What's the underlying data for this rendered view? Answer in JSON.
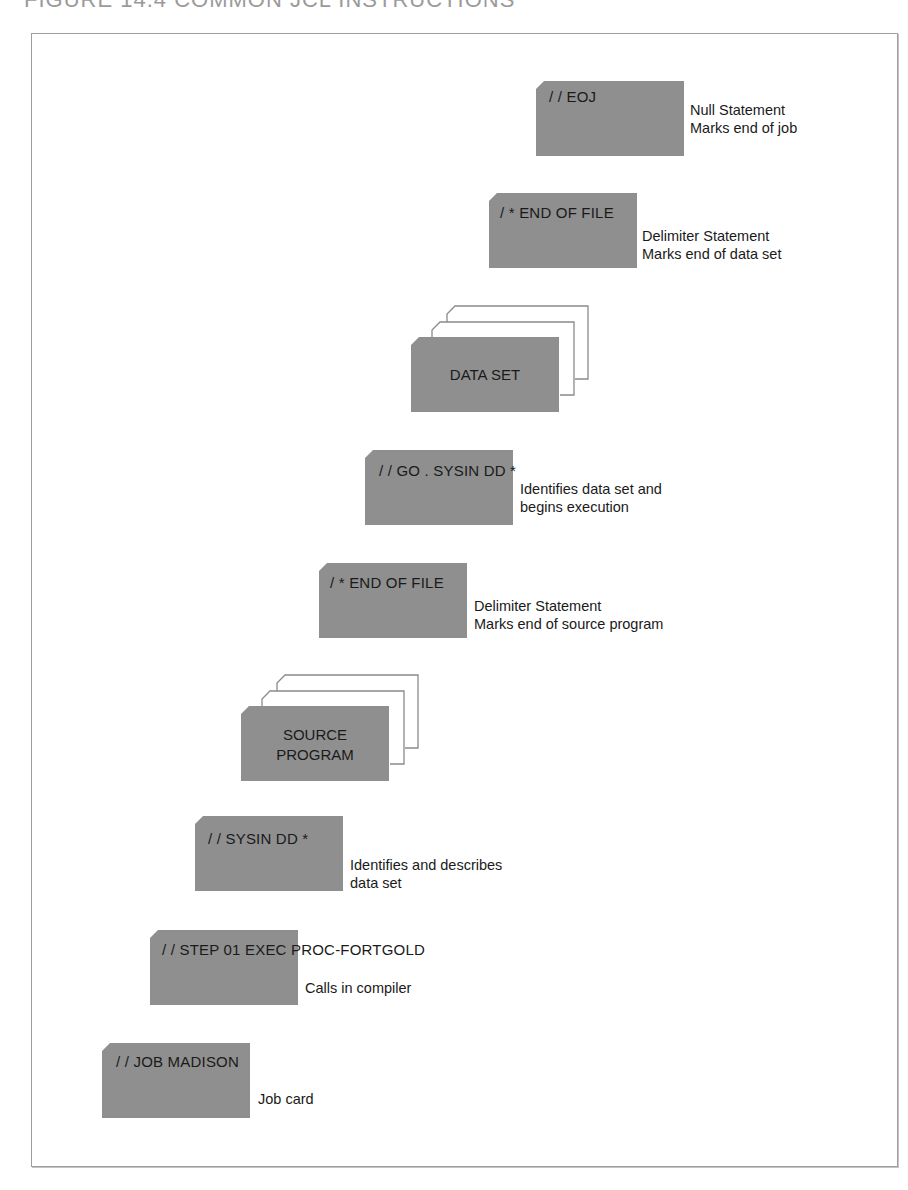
{
  "figure": {
    "title": "FIGURE 14.4   COMMON JCL INSTRUCTIONS"
  },
  "colors": {
    "card_fill": "#8f8f8f",
    "outline": "#8a8a8a",
    "frame": "#9e9e9e"
  },
  "cards": [
    {
      "code": "/ / EOJ",
      "desc_line1": "Null Statement",
      "desc_line2": "Marks end of job"
    },
    {
      "code": "/ * END OF FILE",
      "desc_line1": "Delimiter Statement",
      "desc_line2": "Marks end of data set"
    },
    {
      "label": "DATA SET"
    },
    {
      "code": "/ / GO . SYSIN DD *",
      "desc_line1": "Identifies data set and",
      "desc_line2": "begins execution"
    },
    {
      "code": "/ * END OF FILE",
      "desc_line1": "Delimiter Statement",
      "desc_line2": "Marks end of source program"
    },
    {
      "label_line1": "SOURCE",
      "label_line2": "PROGRAM"
    },
    {
      "code": "/ / SYSIN  DD *",
      "desc_line1": "Identifies and describes",
      "desc_line2": "data set"
    },
    {
      "code": "/ / STEP 01 EXEC PROC-FORTGOLD",
      "desc_line1": "Calls in compiler"
    },
    {
      "code": "/ / JOB MADISON",
      "desc_line1": "Job card"
    }
  ]
}
